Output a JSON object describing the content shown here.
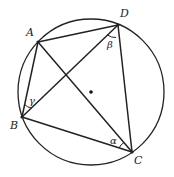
{
  "diagram": {
    "title": "",
    "circle": {
      "cx": 91,
      "cy": 92,
      "r": 73
    },
    "center_dot": {
      "x": 91,
      "y": 92
    },
    "points": {
      "A": {
        "x": 38,
        "y": 42,
        "label": "A",
        "lx": 26,
        "ly": 36
      },
      "D": {
        "x": 118,
        "y": 25,
        "label": "D",
        "lx": 120,
        "ly": 17
      },
      "B": {
        "x": 22,
        "y": 117,
        "label": "B",
        "lx": 10,
        "ly": 129
      },
      "C": {
        "x": 132,
        "y": 152,
        "label": "C",
        "lx": 134,
        "ly": 164
      }
    },
    "angles": {
      "alpha": {
        "label": "α",
        "x": 110,
        "y": 144
      },
      "beta": {
        "label": "β",
        "x": 107,
        "y": 48
      },
      "gamma": {
        "label": "γ",
        "x": 29,
        "y": 104
      }
    }
  }
}
